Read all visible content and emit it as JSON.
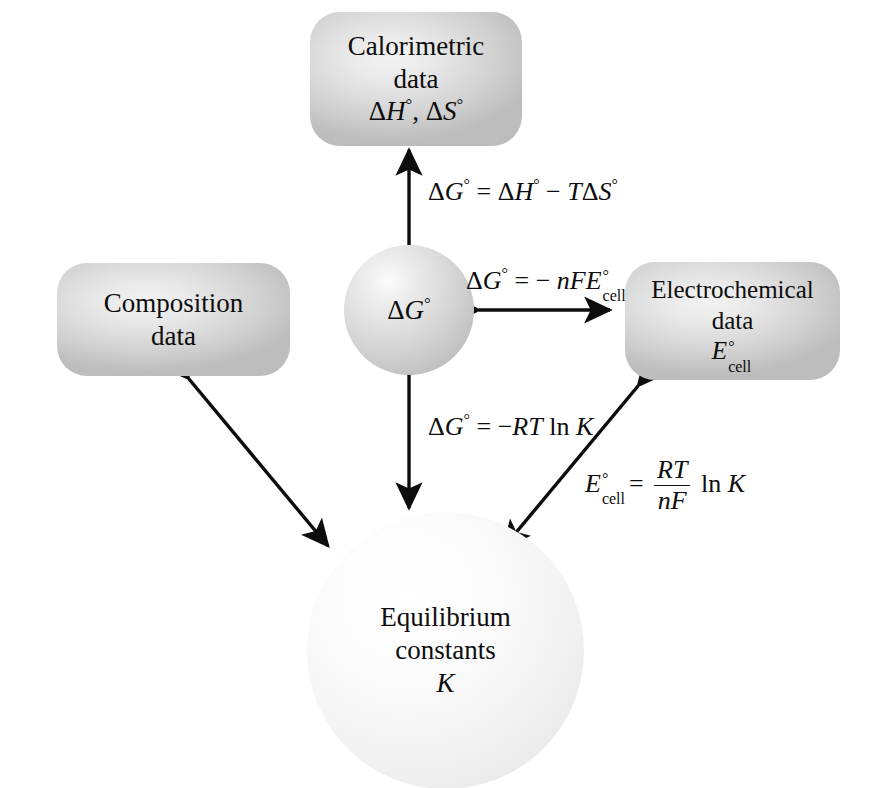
{
  "diagram": {
    "colors": {
      "background": "#ffffff",
      "box_fill_light": "#f2f2f2",
      "box_fill_dark": "#bdbdbd",
      "sphere_dg_light": "#fbfbfb",
      "sphere_dg_dark": "#acacac",
      "sphere_k_light": "#ffffff",
      "sphere_k_dark": "#dcdcdc",
      "stroke": "#0d0d0d",
      "text": "#0d0d0d"
    },
    "nodes": {
      "calorimetric": {
        "line1": "Calorimetric",
        "line2": "data",
        "line3_a": "H",
        "line3_b": "S"
      },
      "composition": {
        "line1": "Composition",
        "line2": "data"
      },
      "electrochemical": {
        "line1": "Electrochemical",
        "line2": "data",
        "symbol_base": "E",
        "symbol_sup": "°",
        "symbol_sub": "cell"
      },
      "free_energy": {
        "symbol": "ΔG",
        "symbol_sup": "°"
      },
      "equilibrium": {
        "line1": "Equilibrium",
        "line2": "constants",
        "line3": "K"
      }
    },
    "equations": {
      "gibbs_helmholtz": {
        "lhs_delta": "Δ",
        "lhs_var": "G",
        "lhs_sup": "°",
        "eq": "=",
        "t1_delta": "Δ",
        "t1_var": "H",
        "t1_sup": "°",
        "minus": "−",
        "t2_var": "T",
        "t2_delta": "Δ",
        "t2_var2": "S",
        "t2_sup": "°",
        "plain": "ΔG° = ΔH° − TΔS°"
      },
      "nernst_free_energy": {
        "lhs_delta": "Δ",
        "lhs_var": "G",
        "lhs_sup": "°",
        "eq": "=",
        "minus": "−",
        "n": "n",
        "f": "F",
        "e": "E",
        "e_sup": "°",
        "e_sub": "cell",
        "plain": "ΔG° = − nFE°cell"
      },
      "free_energy_k": {
        "lhs_delta": "Δ",
        "lhs_var": "G",
        "lhs_sup": "°",
        "eq": "=",
        "minus": "−",
        "r": "R",
        "t": "T",
        "ln": "ln",
        "k": "K",
        "plain": "ΔG° = −RT ln K"
      },
      "cell_potential_k": {
        "lhs_var": "E",
        "lhs_sup": "°",
        "lhs_sub": "cell",
        "eq": "=",
        "numerator": "RT",
        "denominator": "nF",
        "ln": "ln",
        "k": "K",
        "plain": "E°cell = (RT/nF) ln K"
      }
    },
    "arrows": [
      {
        "name": "calorimetric-free-energy",
        "direction": "double",
        "orientation": "vertical"
      },
      {
        "name": "free-energy-electrochemical",
        "direction": "double",
        "orientation": "horizontal"
      },
      {
        "name": "free-energy-equilibrium",
        "direction": "double",
        "orientation": "vertical"
      },
      {
        "name": "composition-equilibrium",
        "direction": "double",
        "orientation": "diagonal"
      },
      {
        "name": "electrochemical-equilibrium",
        "direction": "double",
        "orientation": "diagonal"
      }
    ]
  }
}
